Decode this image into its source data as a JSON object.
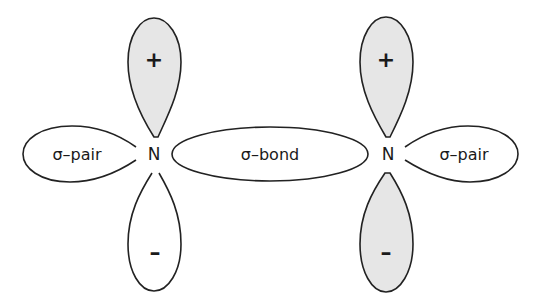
{
  "diagram": {
    "title": "",
    "atoms": [
      {
        "symbol": "N",
        "position": "left"
      },
      {
        "symbol": "N",
        "position": "right"
      }
    ],
    "horizontal_orbitals": {
      "left_lone_pair": "σ–pair",
      "bond": "σ–bond",
      "right_lone_pair": "σ–pair"
    },
    "p_orbitals": {
      "left": {
        "upper_sign": "+",
        "lower_sign": "–",
        "upper_shaded": true,
        "lower_shaded": false
      },
      "right": {
        "upper_sign": "+",
        "lower_sign": "–",
        "upper_shaded": true,
        "lower_shaded": true
      }
    },
    "colors": {
      "stroke": "#222222",
      "shade": "#e6e6e6",
      "background": "#ffffff"
    }
  }
}
